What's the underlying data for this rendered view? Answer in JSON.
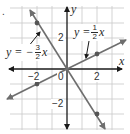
{
  "figure": {
    "marker": ".",
    "axes": {
      "x_label": "x",
      "y_label": "y",
      "origin_label": "0",
      "x_tick_labels": [
        {
          "value": -2,
          "text": "−2"
        },
        {
          "value": 2,
          "text": "2"
        }
      ],
      "y_tick_labels": [
        {
          "value": 2,
          "text": "2"
        },
        {
          "value": -2,
          "text": "−2"
        }
      ],
      "xlim": [
        -3.8,
        3.7
      ],
      "ylim": [
        -3.9,
        4.1
      ],
      "grid": true,
      "grid_step": 1
    },
    "lines": [
      {
        "name": "steep-line",
        "equation_prefix": "y = −",
        "numerator": "3",
        "denominator": "2",
        "equation_suffix": "x",
        "slope": -1.5,
        "marked_points": [
          [
            -2,
            3
          ],
          [
            2,
            -3
          ]
        ]
      },
      {
        "name": "shallow-line",
        "equation_prefix": "y = ",
        "numerator": "1",
        "denominator": "2",
        "equation_suffix": "x",
        "slope": 0.5,
        "marked_points": [
          [
            -2,
            -1
          ],
          [
            2,
            1
          ]
        ]
      }
    ],
    "colors": {
      "grid": "#c8c8c8",
      "axis": "#1a1a1a",
      "line": "#6e6e6e",
      "point": "#555555",
      "text": "#2a2a2a"
    }
  }
}
